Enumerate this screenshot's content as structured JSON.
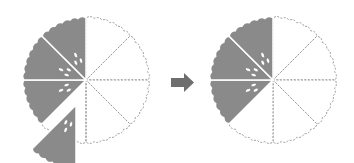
{
  "diagram": {
    "colors": {
      "shaded": "#8a8a8a",
      "outline": "#888888",
      "arrow": "#6e6e6e",
      "background": "#ffffff"
    },
    "left_pie": {
      "cx": 86,
      "cy": 80,
      "r": 62,
      "slices_total": 8,
      "shaded_slices_in_place": 3,
      "removed_slices": 1
    },
    "arrow": {
      "direction": "right"
    },
    "right_pie": {
      "cx": 273,
      "cy": 80,
      "r": 62,
      "slices_total": 8,
      "shaded_slices": 3
    }
  }
}
